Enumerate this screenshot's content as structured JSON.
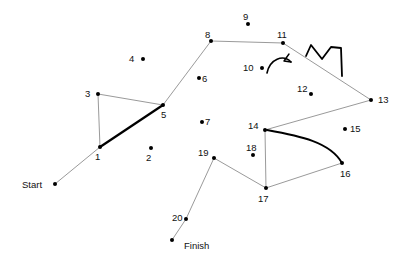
{
  "puzzle": {
    "title": "Connect the Dots",
    "background_color": "#ffffff",
    "dot_color": "#000000",
    "path_color": "#9a9a9a",
    "highlight_color": "#000000",
    "label_color": "#111111",
    "start_label": "Start",
    "finish_label": "Finish",
    "dots": [
      {
        "label": "Start",
        "x": 55,
        "y": 184,
        "label_x": 22,
        "label_y": 180,
        "kind": "endpoint"
      },
      {
        "label": "1",
        "x": 100,
        "y": 147,
        "label_x": 95,
        "label_y": 152,
        "kind": "numbered"
      },
      {
        "label": "2",
        "x": 151,
        "y": 148,
        "label_x": 146,
        "label_y": 153,
        "kind": "numbered"
      },
      {
        "label": "3",
        "x": 98,
        "y": 94,
        "label_x": 85,
        "label_y": 89,
        "kind": "numbered"
      },
      {
        "label": "4",
        "x": 143,
        "y": 59,
        "label_x": 129,
        "label_y": 54,
        "kind": "numbered"
      },
      {
        "label": "5",
        "x": 163,
        "y": 105,
        "label_x": 161,
        "label_y": 110,
        "kind": "numbered"
      },
      {
        "label": "6",
        "x": 199,
        "y": 78,
        "label_x": 202,
        "label_y": 74,
        "kind": "numbered"
      },
      {
        "label": "7",
        "x": 202,
        "y": 122,
        "label_x": 205,
        "label_y": 117,
        "kind": "numbered"
      },
      {
        "label": "8",
        "x": 211,
        "y": 41,
        "label_x": 205,
        "label_y": 30,
        "kind": "numbered"
      },
      {
        "label": "9",
        "x": 248,
        "y": 24,
        "label_x": 243,
        "label_y": 12,
        "kind": "numbered"
      },
      {
        "label": "10",
        "x": 262,
        "y": 68,
        "label_x": 243,
        "label_y": 63,
        "kind": "numbered"
      },
      {
        "label": "11",
        "x": 283,
        "y": 43,
        "label_x": 277,
        "label_y": 30,
        "kind": "numbered"
      },
      {
        "label": "12",
        "x": 311,
        "y": 94,
        "label_x": 297,
        "label_y": 84,
        "kind": "numbered"
      },
      {
        "label": "13",
        "x": 371,
        "y": 100,
        "label_x": 378,
        "label_y": 95,
        "kind": "numbered"
      },
      {
        "label": "14",
        "x": 265,
        "y": 130,
        "label_x": 248,
        "label_y": 121,
        "kind": "numbered"
      },
      {
        "label": "15",
        "x": 345,
        "y": 129,
        "label_x": 350,
        "label_y": 124,
        "kind": "numbered"
      },
      {
        "label": "16",
        "x": 342,
        "y": 163,
        "label_x": 340,
        "label_y": 169,
        "kind": "numbered"
      },
      {
        "label": "17",
        "x": 266,
        "y": 188,
        "label_x": 258,
        "label_y": 194,
        "kind": "numbered"
      },
      {
        "label": "18",
        "x": 253,
        "y": 155,
        "label_x": 246,
        "label_y": 143,
        "kind": "numbered"
      },
      {
        "label": "19",
        "x": 214,
        "y": 158,
        "label_x": 198,
        "label_y": 148,
        "kind": "numbered"
      },
      {
        "label": "20",
        "x": 186,
        "y": 219,
        "label_x": 172,
        "label_y": 213,
        "kind": "numbered"
      },
      {
        "label": "Finish",
        "x": 172,
        "y": 240,
        "label_x": 184,
        "label_y": 241,
        "kind": "endpoint"
      }
    ],
    "segments": [
      {
        "from": "Start",
        "to": "1",
        "style": "thin"
      },
      {
        "from": "1",
        "to": "3",
        "style": "thin"
      },
      {
        "from": "3",
        "to": "5",
        "style": "thin"
      },
      {
        "from": "1",
        "to": "5",
        "style": "thick"
      },
      {
        "from": "5",
        "to": "8",
        "style": "thin"
      },
      {
        "from": "8",
        "to": "11",
        "style": "thin"
      },
      {
        "from": "11",
        "to": "13",
        "style": "thin"
      },
      {
        "from": "13",
        "to": "14",
        "style": "thin"
      },
      {
        "from": "14",
        "to": "17",
        "style": "thin"
      },
      {
        "from": "17",
        "to": "16",
        "style": "thin"
      },
      {
        "from": "19",
        "to": "17",
        "style": "thin"
      },
      {
        "from": "19",
        "to": "20",
        "style": "thin"
      },
      {
        "from": "20",
        "to": "Finish",
        "style": "thin"
      }
    ],
    "strokes": [
      {
        "name": "zigzag-crown-stroke",
        "points": "306,56 311,45 322,59 331,47 341,48 342,76",
        "style": "thick"
      },
      {
        "name": "curve-14-to-16-stroke",
        "path": "M 267,130 C 300,136 330,142 342,163",
        "style": "thick"
      }
    ],
    "arrow": {
      "name": "rotation-arrow",
      "path": "M 267,73 C 270,59 283,54 291,62",
      "head": "291,62 284,61 289,54"
    }
  }
}
